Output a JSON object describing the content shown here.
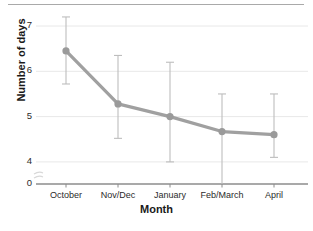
{
  "chart_data": {
    "type": "line",
    "title": "",
    "xlabel": "Month",
    "ylabel": "Number of days",
    "categories": [
      "October",
      "Nov/Dec",
      "January",
      "Feb/March",
      "April"
    ],
    "values": [
      6.45,
      5.28,
      5.0,
      4.67,
      4.6
    ],
    "error_upper": [
      7.2,
      6.35,
      6.2,
      5.5,
      5.5
    ],
    "error_lower": [
      5.72,
      4.52,
      4.0,
      3.05,
      4.1
    ],
    "yticks": [
      "0",
      "4",
      "5",
      "6",
      "7"
    ],
    "ylim": [
      3.0,
      7.45
    ],
    "axis_break": true,
    "grid": "horizontal",
    "legend": "none",
    "series_color": "#a0a0a0",
    "marker_color": "#9a9a9a",
    "errorbar_color": "#bdbdbd",
    "grid_color": "#e8e8e8",
    "axis_color": "#8c8c8c",
    "text_color": "#2b2b2b"
  }
}
